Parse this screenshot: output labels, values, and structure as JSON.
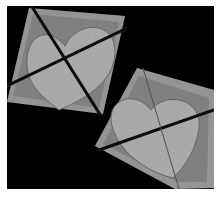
{
  "image": {
    "description": "Grayscale micrograph-style image on black background showing two rotated square tiles, each containing a pale heart-shaped region bisected by dark diagonal lines",
    "colors": {
      "background": "#000000",
      "frame": "#ffffff",
      "tile_fill": "#8a8a8a",
      "tile_edge_texture": "#a8a8a8",
      "heart_fill": "#b2b2b2",
      "line": "#0a0a0a"
    }
  }
}
